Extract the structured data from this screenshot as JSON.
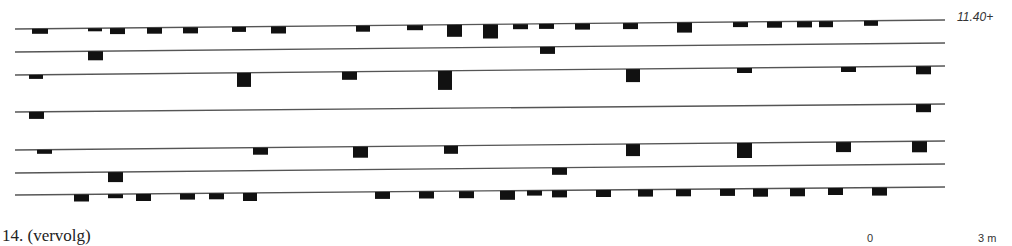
{
  "figure": {
    "caption": "14. (vervolg)",
    "level_label": "11.40+",
    "scale": {
      "start_label": "0",
      "end_label": "3 m"
    }
  },
  "colors": {
    "line": "#555555",
    "block": "#111111",
    "background": "#ffffff"
  },
  "rows": [
    {
      "id": 1,
      "y_left": 29,
      "y_right": 20,
      "blocks": [
        [
          32,
          16,
          5
        ],
        [
          88,
          14,
          3
        ],
        [
          110,
          15,
          6
        ],
        [
          147,
          15,
          6
        ],
        [
          183,
          15,
          6
        ],
        [
          232,
          14,
          5
        ],
        [
          271,
          15,
          7
        ],
        [
          356,
          14,
          6
        ],
        [
          407,
          16,
          5
        ],
        [
          447,
          15,
          12
        ],
        [
          483,
          15,
          14
        ],
        [
          513,
          15,
          5
        ],
        [
          539,
          15,
          5
        ],
        [
          575,
          15,
          6
        ],
        [
          623,
          15,
          6
        ],
        [
          677,
          15,
          10
        ],
        [
          733,
          15,
          5
        ],
        [
          767,
          15,
          6
        ],
        [
          797,
          15,
          6
        ],
        [
          819,
          14,
          6
        ],
        [
          864,
          14,
          5
        ]
      ]
    },
    {
      "id": 2,
      "y_left": 52,
      "y_right": 43,
      "blocks": [
        [
          88,
          15,
          9
        ],
        [
          540,
          15,
          7
        ]
      ]
    },
    {
      "id": 3,
      "y_left": 75,
      "y_right": 66,
      "blocks": [
        [
          29,
          14,
          4
        ],
        [
          237,
          14,
          14
        ],
        [
          342,
          15,
          8
        ],
        [
          438,
          14,
          19
        ],
        [
          626,
          14,
          13
        ],
        [
          737,
          15,
          5
        ],
        [
          841,
          15,
          5
        ],
        [
          916,
          15,
          8
        ]
      ]
    },
    {
      "id": 4,
      "y_left": 112,
      "y_right": 104,
      "blocks": [
        [
          29,
          15,
          7
        ],
        [
          916,
          15,
          8
        ]
      ]
    },
    {
      "id": 5,
      "y_left": 150,
      "y_right": 141,
      "blocks": [
        [
          37,
          15,
          4
        ],
        [
          253,
          15,
          7
        ],
        [
          353,
          15,
          11
        ],
        [
          444,
          14,
          8
        ],
        [
          626,
          14,
          12
        ],
        [
          737,
          15,
          15
        ],
        [
          836,
          15,
          10
        ],
        [
          912,
          15,
          11
        ]
      ]
    },
    {
      "id": 6,
      "y_left": 173,
      "y_right": 164,
      "blocks": [
        [
          108,
          15,
          10
        ],
        [
          552,
          15,
          7
        ]
      ]
    },
    {
      "id": 7,
      "y_left": 195,
      "y_right": 187,
      "blocks": [
        [
          74,
          15,
          7
        ],
        [
          108,
          15,
          4
        ],
        [
          136,
          15,
          7
        ],
        [
          180,
          15,
          6
        ],
        [
          209,
          15,
          6
        ],
        [
          243,
          14,
          8
        ],
        [
          375,
          15,
          7
        ],
        [
          419,
          15,
          7
        ],
        [
          459,
          15,
          7
        ],
        [
          500,
          15,
          9
        ],
        [
          527,
          15,
          5
        ],
        [
          552,
          15,
          7
        ],
        [
          596,
          15,
          7
        ],
        [
          638,
          15,
          7
        ],
        [
          676,
          15,
          7
        ],
        [
          720,
          15,
          7
        ],
        [
          753,
          15,
          8
        ],
        [
          790,
          15,
          8
        ],
        [
          828,
          15,
          7
        ],
        [
          872,
          15,
          8
        ]
      ]
    }
  ],
  "line_extent": {
    "x_start": 15,
    "x_end": 945
  }
}
